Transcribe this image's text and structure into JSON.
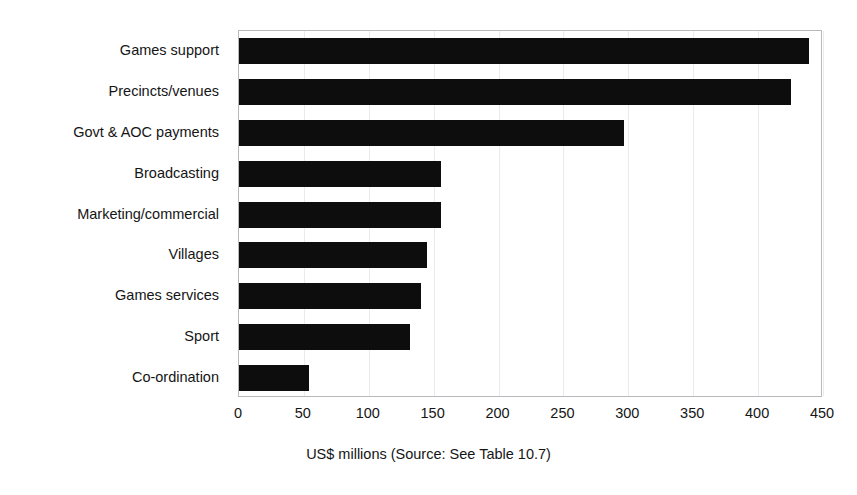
{
  "chart_data": {
    "type": "bar",
    "orientation": "horizontal",
    "title": "",
    "categories": [
      "Games support",
      "Precincts/venues",
      "Govt & AOC payments",
      "Broadcasting",
      "Marketing/commercial",
      "Villages",
      "Games services",
      "Sport",
      "Co-ordination"
    ],
    "values": [
      439,
      425,
      297,
      156,
      156,
      145,
      140,
      132,
      54
    ],
    "xlabel": "US$ millions (Source: See Table 10.7)",
    "ylabel": "",
    "xlim": [
      0,
      450
    ],
    "xticks": [
      0,
      50,
      100,
      150,
      200,
      250,
      300,
      350,
      400,
      450
    ],
    "xtick_labels": [
      "0",
      "50",
      "100",
      "150",
      "200",
      "250",
      "300",
      "350",
      "400",
      "450"
    ],
    "grid": "vertical",
    "legend": "none",
    "bar_color": "#0d0d0d",
    "plot_border_color": "#b9b9bd",
    "gridline_color": "#ebebee"
  },
  "axis_caption": "US$ millions (Source: See Table 10.7)",
  "title_remnant": ""
}
